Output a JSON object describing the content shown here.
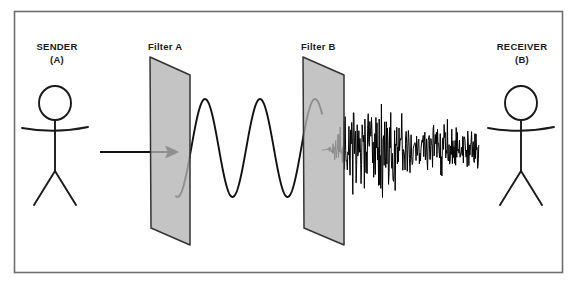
{
  "diagram": {
    "frame": {
      "x": 14,
      "y": 11,
      "width": 548,
      "height": 261,
      "border_color": "#6e6e6e",
      "fill": "#ffffff"
    },
    "labels": {
      "sender": "SENDER",
      "sender_sub": "(A)",
      "receiver": "RECEIVER",
      "receiver_sub": "(B)",
      "filter_a": "Filter A",
      "filter_b": "Filter B"
    },
    "colors": {
      "stroke": "#1a1a1a",
      "filter_fill": "#b3b3b3",
      "filter_stroke": "#333333",
      "frame_border": "#6e6e6e",
      "background": "#ffffff",
      "wave": "#111111",
      "noise": "#000000"
    },
    "figures": [
      {
        "name": "sender-stick-figure",
        "head": {
          "cx": 55,
          "cy": 103,
          "rx": 16,
          "ry": 17
        },
        "body": {
          "x": 55,
          "y1": 120,
          "y2": 171
        },
        "arms": {
          "y": 130,
          "x1": 22,
          "x2": 88,
          "droop": 3
        },
        "legs": {
          "hip_x": 55,
          "hip_y": 171,
          "left_x": 34,
          "right_y": 205,
          "right_x": 76
        }
      },
      {
        "name": "receiver-stick-figure",
        "head": {
          "cx": 521,
          "cy": 103,
          "rx": 16,
          "ry": 17
        },
        "body": {
          "x": 521,
          "y1": 120,
          "y2": 171
        },
        "arms": {
          "y": 130,
          "x1": 488,
          "x2": 554,
          "droop": 3
        },
        "legs": {
          "hip_x": 521,
          "hip_y": 171,
          "left_x": 500,
          "right_y": 205,
          "right_x": 542
        }
      }
    ],
    "filters": [
      {
        "name": "filter-a-plane",
        "label": "Filter A",
        "points": "150,57 190,75 190,245 151,228"
      },
      {
        "name": "filter-b-plane",
        "label": "Filter B",
        "points": "303,57 344,75 344,245 304,228"
      }
    ],
    "arrow": {
      "name": "input-arrow",
      "x1": 100,
      "x2": 178,
      "y": 152,
      "head_size": 7
    },
    "signals": {
      "clean_wave": {
        "name": "sine-wave-signal",
        "description": "smooth high-amplitude sine wave between Filter A and Filter B",
        "x_start": 176,
        "x_end": 322,
        "baseline_y": 148,
        "amplitude": 49,
        "period": 55,
        "phase_deg": 260
      },
      "noisy_wave": {
        "name": "noise-signal",
        "description": "dense high-frequency noisy waveform after Filter B toward receiver",
        "x_start": 322,
        "x_end": 479,
        "baseline_y": 150,
        "max_amplitude": 56,
        "ramp_in_x": 345
      }
    }
  }
}
